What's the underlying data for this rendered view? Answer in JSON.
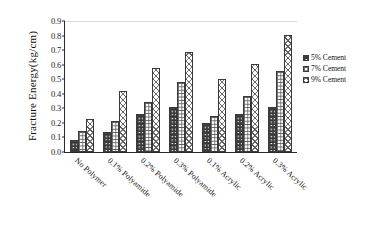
{
  "chart_data": {
    "type": "bar",
    "title": "",
    "xlabel": "",
    "ylabel": "Fracture Energy(kg/cm)",
    "ylim": [
      0,
      0.9
    ],
    "ytick_labels": [
      "0.9",
      "0.8",
      "0.7",
      "0.6",
      "0.5",
      "0.4",
      "0.3",
      "0.2",
      "0.1",
      "0.0"
    ],
    "ytick_values": [
      0.9,
      0.8,
      0.7,
      0.6,
      0.5,
      0.4,
      0.3,
      0.2,
      0.1,
      0.0
    ],
    "grid": false,
    "legend_position": "right",
    "categories": [
      "No Polymer",
      "0.1% Polyamide",
      "0.2% Polyamide",
      "0.3% Polyamide",
      "0.1% Acrylic",
      "0.2% Acrylic",
      "0.3% Acrylic"
    ],
    "series": [
      {
        "name": "5% Cement",
        "pattern": "dotted-blocks",
        "values": [
          0.08,
          0.14,
          0.26,
          0.31,
          0.2,
          0.26,
          0.31
        ]
      },
      {
        "name": "7% Cement",
        "pattern": "grid",
        "values": [
          0.145,
          0.21,
          0.345,
          0.48,
          0.245,
          0.385,
          0.555
        ]
      },
      {
        "name": "9% Cement",
        "pattern": "diagonal-crosshatch",
        "values": [
          0.225,
          0.42,
          0.575,
          0.69,
          0.5,
          0.605,
          0.805
        ]
      }
    ]
  },
  "legend": {
    "items": [
      {
        "label": "5% Cement"
      },
      {
        "label": "7% Cement"
      },
      {
        "label": "9% Cement"
      }
    ]
  },
  "colors": {
    "axis": "#2b2b2b",
    "background": "#ffffff",
    "bar_outline": "#3a3a3a",
    "top_rule": "#d9d9d9"
  }
}
